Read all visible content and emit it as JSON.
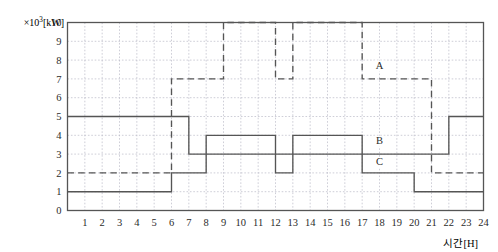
{
  "chart_data": {
    "type": "line",
    "title": "",
    "subtitle": "",
    "xlabel": "시간[H]",
    "ylabel": "×10³[kW]",
    "y_unit_prefix": "×10",
    "y_unit_exponent": "3",
    "y_unit_suffix": "[kW]",
    "xlim": [
      0,
      24
    ],
    "ylim": [
      0,
      10
    ],
    "grid": true,
    "grid_style": "dotted",
    "legend_position": "inline-annotation",
    "step_type": "post",
    "x_ticks": [
      1,
      2,
      3,
      4,
      5,
      6,
      7,
      8,
      9,
      10,
      11,
      12,
      13,
      14,
      15,
      16,
      17,
      18,
      19,
      20,
      21,
      22,
      23,
      24
    ],
    "y_ticks": [
      0,
      1,
      2,
      3,
      4,
      5,
      6,
      7,
      8,
      9,
      10
    ],
    "series": [
      {
        "name": "A",
        "line_style": "dashed",
        "color": "#555555",
        "label_x": 18.0,
        "label_y": 7.55,
        "steps": [
          {
            "from": 0,
            "to": 6,
            "value": 2
          },
          {
            "from": 6,
            "to": 9,
            "value": 7
          },
          {
            "from": 9,
            "to": 12,
            "value": 10
          },
          {
            "from": 12,
            "to": 13,
            "value": 7
          },
          {
            "from": 13,
            "to": 17,
            "value": 10
          },
          {
            "from": 17,
            "to": 21,
            "value": 7
          },
          {
            "from": 21,
            "to": 24,
            "value": 2
          }
        ]
      },
      {
        "name": "B",
        "line_style": "solid",
        "color": "#555555",
        "label_x": 18.0,
        "label_y": 3.55,
        "steps": [
          {
            "from": 0,
            "to": 7,
            "value": 5
          },
          {
            "from": 7,
            "to": 22,
            "value": 3
          },
          {
            "from": 22,
            "to": 24,
            "value": 5
          }
        ]
      },
      {
        "name": "C",
        "line_style": "solid",
        "color": "#555555",
        "label_x": 18.0,
        "label_y": 2.4,
        "steps": [
          {
            "from": 0,
            "to": 6,
            "value": 1
          },
          {
            "from": 6,
            "to": 8,
            "value": 2
          },
          {
            "from": 8,
            "to": 12,
            "value": 4
          },
          {
            "from": 12,
            "to": 13,
            "value": 2
          },
          {
            "from": 13,
            "to": 17,
            "value": 4
          },
          {
            "from": 17,
            "to": 20,
            "value": 2
          },
          {
            "from": 20,
            "to": 24,
            "value": 1
          }
        ]
      }
    ]
  },
  "colors": {
    "axis": "#555555",
    "grid": "#b9b9c6",
    "curve": "#555555",
    "text": "#2b2b2b",
    "background": "#ffffff"
  }
}
